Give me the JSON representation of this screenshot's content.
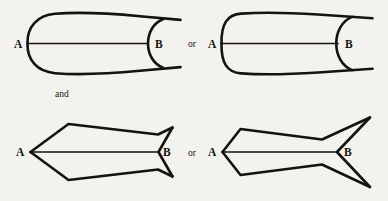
{
  "plate": {
    "name": "muller-lyer-illusion-plate",
    "background_color": "#f4f2ee",
    "ink_color": "#151312",
    "width": 388,
    "height": 201
  },
  "connectors": {
    "or_top_label": "or",
    "and_label": "and",
    "or_bottom_label": "or"
  },
  "figures": [
    {
      "id": "curved-left",
      "row": "top",
      "position": "left",
      "style": "curved-fins",
      "left_label": "A",
      "right_label": "B",
      "left_cap": "convex-arc-outward",
      "right_cap": "concave-arc-inward",
      "shaft_description": "horizontal line from A to B"
    },
    {
      "id": "curved-right",
      "row": "top",
      "position": "right",
      "style": "curved-fins",
      "left_label": "A",
      "right_label": "B",
      "left_cap": "rounded-square-cap-outward",
      "right_cap": "concave-arc-inward",
      "shaft_description": "horizontal line from A to B"
    },
    {
      "id": "angular-left",
      "row": "bottom",
      "position": "left",
      "style": "angular-fins",
      "left_label": "A",
      "right_label": "B",
      "left_cap": "outward-pointing-vertex",
      "right_cap": "inward-notch-vertex",
      "shaft_description": "horizontal line from A to B"
    },
    {
      "id": "angular-right",
      "row": "bottom",
      "position": "right",
      "style": "angular-fins",
      "left_label": "A",
      "right_label": "B",
      "left_cap": "outward-pointing-vertex",
      "right_cap": "inward-notch-vertex",
      "shaft_description": "horizontal line from A to B"
    }
  ],
  "labels": {
    "fig1_A": "A",
    "fig1_B": "B",
    "fig2_A": "A",
    "fig2_B": "B",
    "fig3_A": "A",
    "fig3_B": "B",
    "fig4_A": "A",
    "fig4_B": "B"
  }
}
